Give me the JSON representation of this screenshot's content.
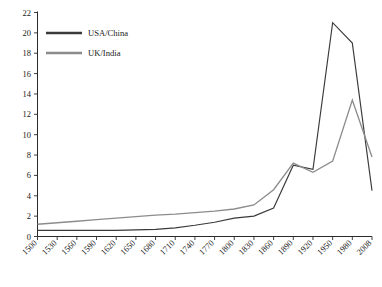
{
  "chart_data": {
    "type": "line",
    "title": "",
    "xlabel": "",
    "ylabel": "",
    "ylim": [
      0,
      22
    ],
    "ytick_step": 2,
    "grid": false,
    "legend_position": "top-left",
    "categories": [
      "1500",
      "1530",
      "1560",
      "1590",
      "1620",
      "1650",
      "1680",
      "1710",
      "1740",
      "1770",
      "1800",
      "1830",
      "1860",
      "1890",
      "1920",
      "1950",
      "1980",
      "2008"
    ],
    "yticks": [
      "0",
      "2",
      "4",
      "6",
      "8",
      "10",
      "12",
      "14",
      "16",
      "18",
      "20",
      "22"
    ],
    "series": [
      {
        "name": "USA/China",
        "color": "#3a3a3a",
        "values": [
          0.6,
          0.6,
          0.6,
          0.6,
          0.6,
          0.65,
          0.7,
          0.85,
          1.1,
          1.4,
          1.8,
          2.0,
          2.8,
          7.0,
          6.6,
          21.0,
          19.0,
          4.5
        ]
      },
      {
        "name": "UK/India",
        "color": "#8c8c8c",
        "values": [
          1.2,
          1.35,
          1.5,
          1.65,
          1.8,
          1.95,
          2.1,
          2.2,
          2.35,
          2.5,
          2.7,
          3.1,
          4.6,
          7.2,
          6.3,
          7.4,
          13.4,
          7.8
        ]
      }
    ]
  },
  "legend": {
    "entries": [
      {
        "label": "USA/China",
        "color": "#3a3a3a"
      },
      {
        "label": "UK/India",
        "color": "#8c8c8c"
      }
    ]
  }
}
